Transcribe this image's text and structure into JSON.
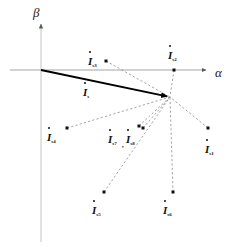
{
  "figure": {
    "title": "",
    "axes": {
      "alpha": {
        "label": "α",
        "x": 215,
        "y": 66
      },
      "beta": {
        "label": "β",
        "x": 33,
        "y": 6
      }
    }
  },
  "chart_data": {
    "type": "scatter",
    "title": "",
    "xlabel": "α",
    "ylabel": "β",
    "grid": false,
    "legend": null,
    "origin": {
      "x": 41,
      "y": 70
    },
    "main_vector": {
      "name": "I_s",
      "label_base": "I",
      "label_sub": "s",
      "from": {
        "x": 41,
        "y": 70
      },
      "to": {
        "x": 170,
        "y": 97
      },
      "style": "solid-bold-arrow",
      "label_pos": {
        "x": 83,
        "y": 83
      }
    },
    "hub": {
      "x": 170,
      "y": 97
    },
    "points": [
      {
        "name": "I_s3",
        "label_base": "I",
        "label_sub": "s3",
        "dot": {
          "x": 106,
          "y": 61
        },
        "label_pos": {
          "x": 88,
          "y": 52
        },
        "connector": "dashed-to-hub"
      },
      {
        "name": "I_s2",
        "label_base": "I",
        "label_sub": "s2",
        "dot": {
          "x": 174,
          "y": 70
        },
        "label_pos": {
          "x": 168,
          "y": 46
        },
        "connector": "dashed-to-hub"
      },
      {
        "name": "I_s4",
        "label_base": "I",
        "label_sub": "s4",
        "dot": {
          "x": 67,
          "y": 128
        },
        "label_pos": {
          "x": 47,
          "y": 128
        },
        "connector": "dashed-to-hub"
      },
      {
        "name": "I_s7",
        "label_base": "I",
        "label_sub": "s7",
        "dot": {
          "x": 139,
          "y": 126
        },
        "label_pos": {
          "x": 108,
          "y": 130
        },
        "connector": "dashed-to-hub"
      },
      {
        "name": "I_s8",
        "label_base": "I",
        "label_sub": "s8",
        "dot": {
          "x": 143,
          "y": 128
        },
        "label_pos": {
          "x": 126,
          "y": 130
        },
        "connector": "dashed-to-hub"
      },
      {
        "name": "I_s1",
        "label_base": "I",
        "label_sub": "s1",
        "dot": {
          "x": 208,
          "y": 128
        },
        "label_pos": {
          "x": 205,
          "y": 140
        },
        "connector": "dashed-to-hub"
      },
      {
        "name": "I_s5",
        "label_base": "I",
        "label_sub": "s5",
        "dot": {
          "x": 104,
          "y": 192
        },
        "label_pos": {
          "x": 92,
          "y": 201
        },
        "connector": "dashed-to-hub"
      },
      {
        "name": "I_s6",
        "label_base": "I",
        "label_sub": "s6",
        "dot": {
          "x": 173,
          "y": 192
        },
        "label_pos": {
          "x": 163,
          "y": 201
        },
        "connector": "dashed-to-hub"
      }
    ],
    "separators": [
      {
        "text": ",",
        "x": 122,
        "y": 134
      }
    ],
    "colors": {
      "axis": "#9a9a9a",
      "vector": "#000000",
      "dashed": "#8c8c8c",
      "dot": "#111111",
      "text": "#111111",
      "background": "#ffffff"
    }
  }
}
